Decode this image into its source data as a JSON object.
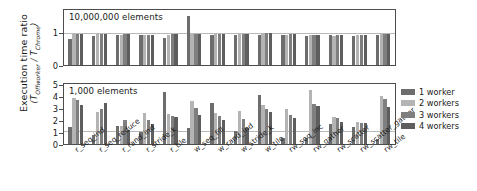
{
  "axis": {
    "ylabel_line1": "Execution time ratio",
    "ylabel_line2_pre": "(T",
    "ylabel_line2_sub1": "Offworker",
    "ylabel_line2_mid": " / T",
    "ylabel_line2_sub2": "Chrome",
    "ylabel_line2_post": ")"
  },
  "legend": {
    "items": [
      {
        "label": "1 worker",
        "color": "#6d6d6d"
      },
      {
        "label": "2 workers",
        "color": "#b4b4b4"
      },
      {
        "label": "3 workers",
        "color": "#7f7f7f"
      },
      {
        "label": "4 workers",
        "color": "#5e5e5e"
      }
    ]
  },
  "chart_data": {
    "type": "bar",
    "title": "",
    "xlabel": "",
    "ylabel": "Execution time ratio (T_Offworker / T_Chrome)",
    "grid": true,
    "gridline_value": 1,
    "legend_position": "right",
    "categories": [
      "r_seq_ind",
      "r_seq_reduce",
      "r_rand_ind",
      "r_stride_k",
      "r_tile",
      "w_seq_fill",
      "w_rand_ind",
      "w_stride_k",
      "w_tile",
      "rw_seq_inc",
      "rw_gather",
      "rw_scatter",
      "rw_scatter_gather",
      "rw_tile"
    ],
    "panels": [
      {
        "name": "10,000,000 elements",
        "title": "10,000,000 elements",
        "ylim": [
          0,
          1.75
        ],
        "yticks": [
          0,
          1
        ],
        "ytick_labels": [
          "0",
          "1"
        ],
        "series": [
          {
            "name": "1 worker",
            "values": [
              0.82,
              0.91,
              0.95,
              0.94,
              0.87,
              1.55,
              0.97,
              0.94,
              0.94,
              0.95,
              0.92,
              0.95,
              0.93,
              0.95
            ]
          },
          {
            "name": "2 workers",
            "values": [
              0.99,
              0.99,
              0.97,
              0.96,
              0.96,
              1.0,
              1.0,
              1.0,
              1.01,
              0.97,
              0.96,
              0.93,
              0.94,
              0.99
            ]
          },
          {
            "name": "3 workers",
            "values": [
              0.99,
              0.99,
              0.98,
              0.96,
              0.98,
              1.0,
              1.0,
              1.0,
              1.01,
              0.98,
              0.96,
              0.94,
              0.95,
              0.99
            ]
          },
          {
            "name": "4 workers",
            "values": [
              0.99,
              0.99,
              0.98,
              0.96,
              0.98,
              1.0,
              1.0,
              1.0,
              1.01,
              0.98,
              0.96,
              0.94,
              0.95,
              0.99
            ]
          }
        ]
      },
      {
        "name": "1,000 elements",
        "title": "1,000 elements",
        "ylim": [
          0,
          5.2
        ],
        "yticks": [
          0,
          1,
          2,
          3,
          4,
          5
        ],
        "ytick_labels": [
          "0",
          "1",
          "2",
          "3",
          "4",
          "5"
        ],
        "series": [
          {
            "name": "1 worker",
            "values": [
              1.45,
              0.8,
              1.55,
              1.05,
              4.55,
              1.4,
              3.55,
              1.15,
              4.25,
              0.55,
              0.5,
              1.75,
              1.45,
              0.45
            ]
          },
          {
            "name": "2 workers",
            "values": [
              3.95,
              2.8,
              1.55,
              2.7,
              2.6,
              3.7,
              2.7,
              2.85,
              3.4,
              3.0,
              4.7,
              2.3,
              1.9,
              4.2
            ]
          },
          {
            "name": "3 workers",
            "values": [
              3.85,
              3.05,
              2.05,
              2.05,
              2.4,
              3.1,
              2.45,
              2.2,
              3.05,
              2.5,
              3.5,
              2.25,
              1.85,
              3.9
            ]
          },
          {
            "name": "4 workers",
            "values": [
              3.4,
              3.55,
              1.25,
              1.75,
              2.3,
              2.55,
              2.05,
              1.35,
              2.8,
              2.25,
              3.3,
              1.9,
              1.8,
              3.2
            ]
          }
        ]
      }
    ]
  }
}
